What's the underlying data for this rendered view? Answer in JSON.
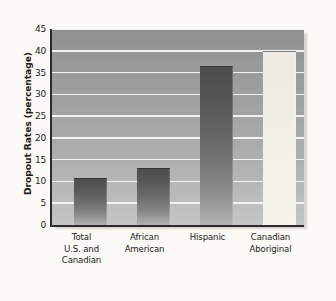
{
  "chart_data": {
    "type": "bar",
    "title": "",
    "subtitle": "",
    "xlabel": "",
    "ylabel": "Dropout Rates (percentage)",
    "ylim": [
      0,
      45
    ],
    "ytick_labels": [
      "0",
      "5",
      "10",
      "15",
      "20",
      "25",
      "30",
      "35",
      "40",
      "45"
    ],
    "yticks": [
      0,
      5,
      10,
      15,
      20,
      25,
      30,
      35,
      40,
      45
    ],
    "grid": true,
    "legend": null,
    "legend_position": "none",
    "categories": [
      "Total\nU.S. and\nCanadian",
      "African\nAmerican",
      "Hispanic",
      "Canadian\nAboriginal"
    ],
    "category_lines": [
      [
        "Total",
        "U.S. and",
        "Canadian"
      ],
      [
        "African",
        "American"
      ],
      [
        "Hispanic"
      ],
      [
        "Canadian",
        "Aboriginal"
      ]
    ],
    "values": [
      10.8,
      13,
      36.5,
      40
    ],
    "bar_styles": [
      "dark",
      "dark",
      "dark",
      "light"
    ],
    "annotations": []
  },
  "colors": {
    "page_background": "#fbfaf6",
    "plot_background_top": "#8f918e",
    "plot_background_bottom": "#c4c6c3",
    "gridline": "#f4f3ef",
    "axis": "#2b2b2b",
    "bar_dark_top": "#4b4d4c",
    "bar_dark_bottom": "#b0b2af",
    "bar_light": "#f1f0e9",
    "text": "#1d1d1d"
  }
}
